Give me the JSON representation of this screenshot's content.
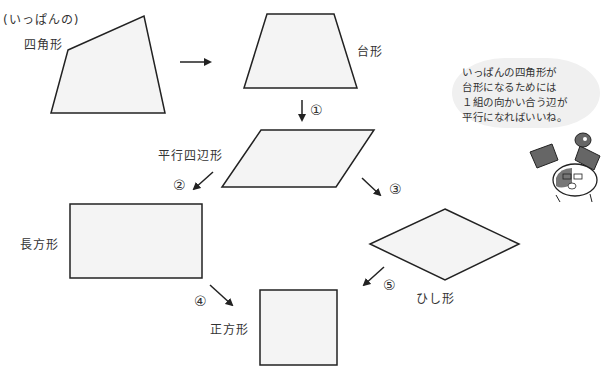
{
  "labels": {
    "general_note": "(いっぱんの)",
    "general_quad": "四角形",
    "trapezoid": "台形",
    "parallelogram": "平行四辺形",
    "rectangle": "長方形",
    "rhombus": "ひし形",
    "square": "正方形"
  },
  "steps": [
    "①",
    "②",
    "③",
    "④",
    "⑤"
  ],
  "speech_bubble": {
    "lines": [
      "いっぱんの四角形が",
      "台形になるためには",
      "１組の向かい合う辺が",
      "平行になればいいね。"
    ]
  },
  "colors": {
    "shape_fill": "#f4f4f4",
    "stroke": "#222222",
    "bubble": "#f0f0f0",
    "character_gray": "#666666"
  }
}
